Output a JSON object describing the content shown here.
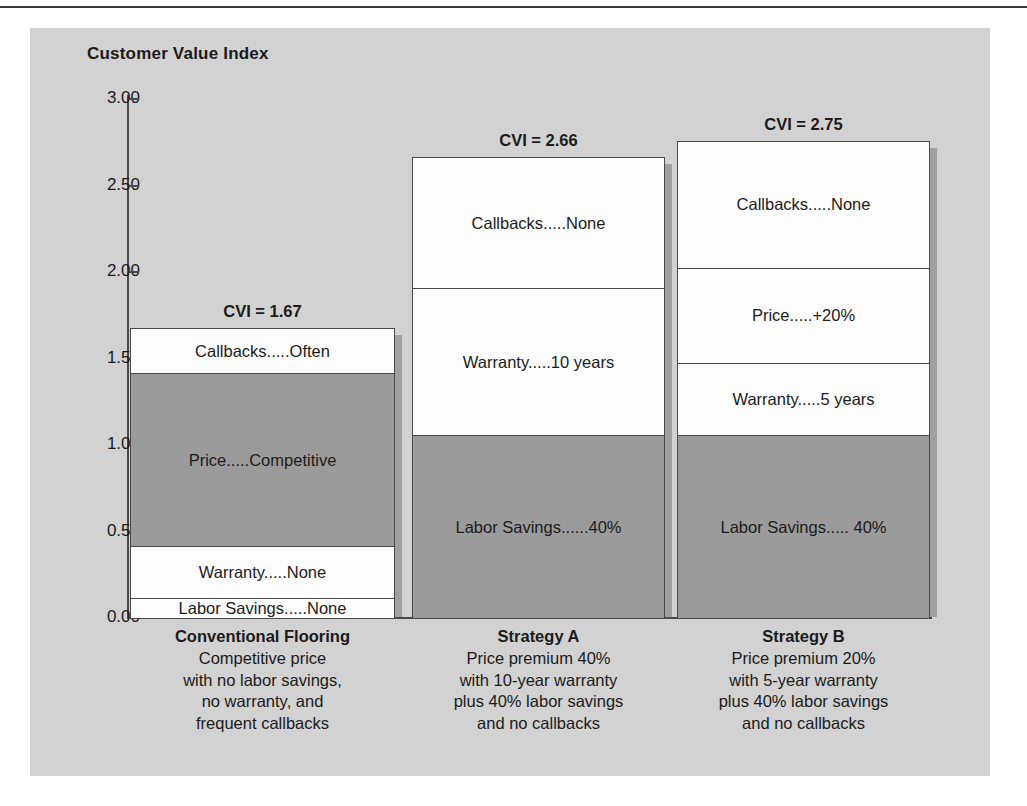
{
  "chart_data": {
    "type": "bar",
    "title": "Customer Value Index",
    "subtitle": "",
    "xlabel": "",
    "ylabel": "Customer Value Index",
    "ylim": [
      0,
      3
    ],
    "grid": false,
    "legend": "none",
    "stacked": true,
    "tick_labels": [
      "3.00",
      "2.50",
      "2.00",
      "1.50",
      "1.00",
      "0.50",
      "0.00"
    ],
    "tick_values": [
      3.0,
      2.5,
      2.0,
      1.5,
      1.0,
      0.5,
      0.0
    ],
    "categories": [
      "Conventional Flooring",
      "Strategy A",
      "Strategy B"
    ],
    "totals": [
      1.67,
      2.66,
      2.75
    ],
    "total_labels": [
      "CVI = 1.67",
      "CVI = 2.66",
      "CVI = 2.75"
    ],
    "series": [
      {
        "name": "Labor Savings",
        "values": [
          0.11,
          1.05,
          1.05
        ],
        "labels": [
          "Labor Savings.....None",
          "Labor Savings......40%",
          "Labor Savings..... 40%"
        ],
        "fills": [
          "white",
          "gray",
          "gray"
        ]
      },
      {
        "name": "Warranty",
        "values": [
          0.3,
          0.85,
          0.42
        ],
        "labels": [
          "Warranty.....None",
          "Warranty.....10 years",
          "Warranty.....5 years"
        ],
        "fills": [
          "white",
          "white",
          "white"
        ]
      },
      {
        "name": "Price",
        "values": [
          1.0,
          0.0,
          0.55
        ],
        "labels": [
          "Price.....Competitive",
          "",
          "Price.....+20%"
        ],
        "fills": [
          "gray",
          "none",
          "white"
        ]
      },
      {
        "name": "Callbacks",
        "values": [
          0.26,
          0.76,
          0.73
        ],
        "labels": [
          "Callbacks.....Often",
          "Callbacks.....None",
          "Callbacks.....None"
        ],
        "fills": [
          "white",
          "white",
          "white"
        ]
      }
    ],
    "colors": {
      "panel_background": "#d2d2d2",
      "bar_fill_gray": "#9b9b9b",
      "bar_fill_white": "#fdfdfd",
      "bar_outline": "#4a4a4a",
      "text": "#1b1b1b"
    }
  },
  "bars": [
    {
      "cvi_label": "CVI = 1.67",
      "segments": [
        {
          "label": "Callbacks.....Often",
          "fill": "white",
          "from": 1.41,
          "to": 1.67
        },
        {
          "label": "Price.....Competitive",
          "fill": "gray",
          "from": 0.41,
          "to": 1.41
        },
        {
          "label": "Warranty.....None",
          "fill": "white",
          "from": 0.11,
          "to": 0.41
        },
        {
          "label": "Labor Savings.....None",
          "fill": "white",
          "from": 0.0,
          "to": 0.11
        }
      ]
    },
    {
      "cvi_label": "CVI = 2.66",
      "segments": [
        {
          "label": "Callbacks.....None",
          "fill": "white",
          "from": 1.9,
          "to": 2.66
        },
        {
          "label": "Warranty.....10 years",
          "fill": "white",
          "from": 1.05,
          "to": 1.9
        },
        {
          "label": "Labor Savings......40%",
          "fill": "gray",
          "from": 0.0,
          "to": 1.05
        }
      ]
    },
    {
      "cvi_label": "CVI = 2.75",
      "segments": [
        {
          "label": "Callbacks.....None",
          "fill": "white",
          "from": 2.02,
          "to": 2.75
        },
        {
          "label": "Price.....+20%",
          "fill": "white",
          "from": 1.47,
          "to": 2.02
        },
        {
          "label": "Warranty.....5 years",
          "fill": "white",
          "from": 1.05,
          "to": 1.47
        },
        {
          "label": "Labor Savings..... 40%",
          "fill": "gray",
          "from": 0.0,
          "to": 1.05
        }
      ]
    }
  ],
  "captions": [
    {
      "title": "Conventional Flooring",
      "lines": [
        "Competitive price",
        "with no labor savings,",
        "no warranty, and",
        "frequent callbacks"
      ]
    },
    {
      "title": "Strategy A",
      "lines": [
        "Price premium 40%",
        "with 10-year warranty",
        "plus 40% labor savings",
        "and no callbacks"
      ]
    },
    {
      "title": "Strategy B",
      "lines": [
        "Price premium 20%",
        "with 5-year warranty",
        "plus 40% labor savings",
        "and no callbacks"
      ]
    }
  ]
}
